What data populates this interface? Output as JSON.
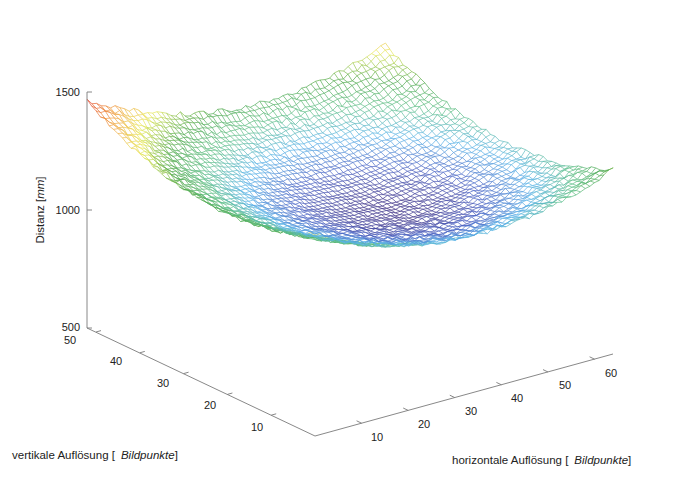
{
  "chart_data": {
    "type": "surface",
    "title": "",
    "xlabel": {
      "prefix": "horizontale Auflösung [",
      "italic": "Bildpunkte",
      "suffix": "]"
    },
    "ylabel": {
      "prefix": "vertikale Auflösung [",
      "italic": "Bildpunkte",
      "suffix": "]"
    },
    "zlabel": {
      "prefix": "Distanz [",
      "italic": "mm",
      "suffix": "]"
    },
    "x_ticks": [
      10,
      20,
      30,
      40,
      50,
      60
    ],
    "y_ticks": [
      10,
      20,
      30,
      40,
      50
    ],
    "z_ticks": [
      500,
      1000,
      1500
    ],
    "xlim": [
      0,
      64
    ],
    "ylim": [
      0,
      52
    ],
    "zlim": [
      500,
      1500
    ],
    "grid": false,
    "colormap": "jet",
    "grid_size": {
      "x": 64,
      "y": 52
    },
    "surface_model": {
      "description": "Bowl-shaped depth map: minimum near center (~1040 mm), rising toward corners (~1300 mm at far-left corner)",
      "center": [
        34,
        26
      ],
      "z_min": 1040,
      "z_corner_far_left": 1300,
      "z_corner_far_top": 1260,
      "z_corner_right": 1150,
      "z_corner_front": 1120,
      "noise_mm": 8
    },
    "colormap_stops": [
      "#3b2a7e",
      "#4a63c4",
      "#5ab4e8",
      "#5fbf8a",
      "#4fa84a",
      "#e8e85a",
      "#f0a040",
      "#e03a2a"
    ]
  },
  "axes": {
    "z_tick_labels": [
      "500",
      "1000",
      "1500"
    ],
    "y_tick_labels": [
      "10",
      "20",
      "30",
      "40",
      "50"
    ],
    "x_tick_labels": [
      "10",
      "20",
      "30",
      "40",
      "50",
      "60"
    ]
  }
}
